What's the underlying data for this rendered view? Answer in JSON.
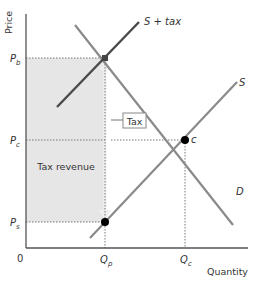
{
  "diagram": {
    "type": "supply-demand-tax",
    "axes": {
      "y_label": "Price",
      "x_label": "Quantity",
      "origin_label": "0"
    },
    "price_levels": [
      {
        "id": "pb",
        "label": "P",
        "sub": "b"
      },
      {
        "id": "pc",
        "label": "P",
        "sub": "c"
      },
      {
        "id": "ps",
        "label": "P",
        "sub": "s"
      }
    ],
    "quantity_levels": [
      {
        "id": "qp",
        "label": "Q",
        "sub": "p"
      },
      {
        "id": "qc",
        "label": "Q",
        "sub": "c"
      }
    ],
    "curves": [
      {
        "id": "s-plus-tax",
        "label": "S + tax"
      },
      {
        "id": "s",
        "label": "S"
      },
      {
        "id": "d",
        "label": "D"
      }
    ],
    "points": [
      {
        "id": "c",
        "label": "c"
      }
    ],
    "annotations": {
      "tax_label": "Tax",
      "tax_revenue_label": "Tax revenue"
    },
    "colors": {
      "axis": "#555555",
      "s_plus_tax": "#4a4a4a",
      "supply": "#8a8a8a",
      "demand": "#8a8a8a",
      "shaded_region": "#e6e6e6",
      "point": "#000000",
      "guide_lines": "#777777"
    }
  }
}
